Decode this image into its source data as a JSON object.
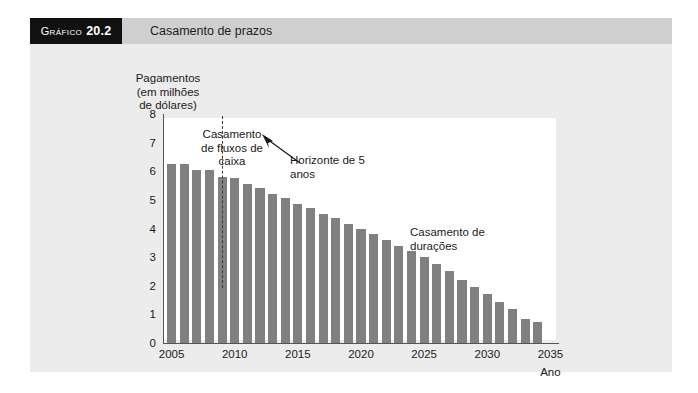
{
  "figure": {
    "label_prefix": "Gráfico",
    "number": "20.2",
    "title": "Casamento de prazos"
  },
  "colors": {
    "bar": "#808080",
    "header_band": "#cfcfcf",
    "number_box": "#111111",
    "card_background": "#ececec",
    "plot_background": "#ffffff",
    "axis": "#555555"
  },
  "annotations": {
    "cash_flow_matching": "Casamento de fluxos de caixa",
    "horizon": "Horizonte de 5 anos",
    "duration_matching": "Casamento de durações"
  },
  "chart_data": {
    "type": "bar",
    "title": "Casamento de prazos",
    "xlabel": "Ano",
    "ylabel": "Pagamentos (em milhões de dólares)",
    "ylabel_lines": [
      "Pagamentos",
      "(em milhões",
      "de dólares)"
    ],
    "xlim": [
      2004.4,
      2035.6
    ],
    "ylim": [
      0,
      8
    ],
    "yticks": [
      0,
      1,
      2,
      3,
      4,
      5,
      6,
      7,
      8
    ],
    "ytick_labels": [
      "0",
      "1",
      "2",
      "3",
      "4",
      "5",
      "6",
      "7",
      "8"
    ],
    "xticks": [
      2005,
      2010,
      2015,
      2020,
      2025,
      2030,
      2035
    ],
    "xtick_labels": [
      "2005",
      "2010",
      "2015",
      "2020",
      "2025",
      "2030",
      "2035"
    ],
    "grid": false,
    "legend": "none",
    "categories": [
      2005,
      2006,
      2007,
      2008,
      2009,
      2010,
      2011,
      2012,
      2013,
      2014,
      2015,
      2016,
      2017,
      2018,
      2019,
      2020,
      2021,
      2022,
      2023,
      2024,
      2025,
      2026,
      2027,
      2028,
      2029,
      2030,
      2031,
      2032,
      2033,
      2034
    ],
    "values": [
      6.25,
      6.25,
      6.05,
      6.05,
      5.8,
      5.75,
      5.55,
      5.4,
      5.2,
      5.05,
      4.85,
      4.7,
      4.5,
      4.35,
      4.15,
      4.0,
      3.8,
      3.6,
      3.4,
      3.2,
      3.0,
      2.75,
      2.5,
      2.2,
      1.95,
      1.7,
      1.45,
      1.2,
      0.85,
      0.75
    ],
    "annotations": [
      {
        "text": "Casamento de fluxos de caixa",
        "x": 2006.6,
        "y": 7.3
      },
      {
        "text": "Horizonte de 5 anos",
        "x": 2012.5,
        "y": 6.5,
        "points_to": 2009.0
      },
      {
        "text": "Casamento de durações",
        "x": 2022.0,
        "y": 4.3
      }
    ],
    "vline": {
      "x": 2009.0,
      "style": "dashed",
      "label": "Horizonte de 5 anos"
    }
  }
}
